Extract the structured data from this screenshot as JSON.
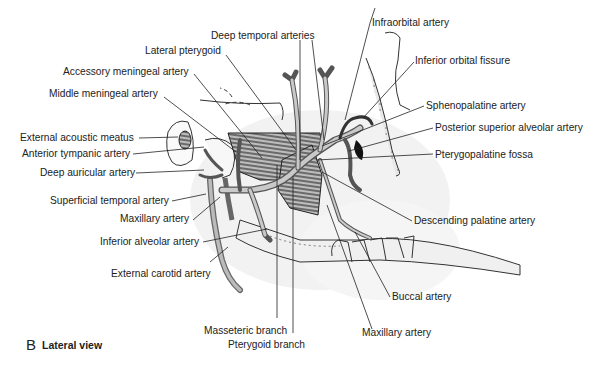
{
  "figure": {
    "panel_letter": "B",
    "panel_title": "Lateral view",
    "labels": {
      "deep_temporal_arteries": "Deep temporal arteries",
      "lateral_pterygoid": "Lateral pterygoid",
      "accessory_meningeal_artery": "Accessory meningeal artery",
      "middle_meningeal_artery": "Middle meningeal artery",
      "external_acoustic_meatus": "External acoustic meatus",
      "anterior_tympanic_artery": "Anterior tympanic artery",
      "deep_auricular_artery": "Deep auricular artery",
      "superficial_temporal_artery": "Superficial temporal artery",
      "maxillary_artery_left": "Maxillary artery",
      "inferior_alveolar_artery": "Inferior alveolar artery",
      "external_carotid_artery": "External carotid artery",
      "masseteric_branch": "Masseteric branch",
      "pterygoid_branch": "Pterygoid branch",
      "infraorbital_artery": "Infraorbital artery",
      "inferior_orbital_fissure": "Inferior orbital fissure",
      "sphenopalatine_artery": "Sphenopalatine artery",
      "posterior_superior_alveolar_artery": "Posterior superior alveolar artery",
      "pterygopalatine_fossa": "Pterygopalatine fossa",
      "descending_palatine_artery": "Descending palatine artery",
      "buccal_artery": "Buccal artery",
      "maxillary_artery_bottom": "Maxillary artery"
    }
  }
}
